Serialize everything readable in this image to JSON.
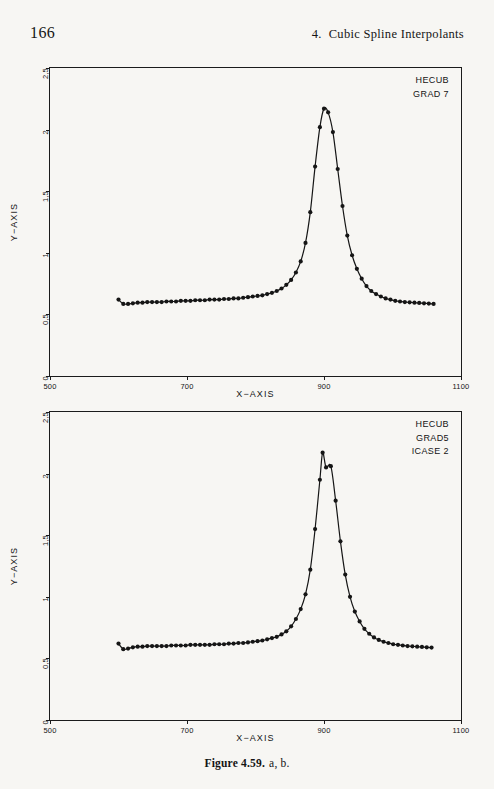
{
  "page": {
    "folio": "166",
    "header_chapter_num": "4.",
    "header_chapter_title": "Cubic Spline Interpolants",
    "background_color": "#f7f6f3",
    "ink_color": "#1b1b1b"
  },
  "caption": {
    "figure_number": "Figure 4.59.",
    "parts": "a, b."
  },
  "chart_data": [
    {
      "id": "figure-a",
      "type": "line",
      "title": "",
      "xlabel": "X−AXIS",
      "ylabel": "Y−AXIS",
      "xlim": [
        500,
        1100
      ],
      "ylim": [
        0,
        2.5
      ],
      "xticks": [
        500,
        700,
        900,
        1100
      ],
      "xticklabels": [
        "500",
        "700",
        "900",
        "1100"
      ],
      "yticks": [
        0,
        0.5,
        1,
        1.5,
        2,
        2.5
      ],
      "yticklabels": [
        "0",
        "0,5",
        "1",
        "1,5",
        "2",
        "2,5"
      ],
      "grid": false,
      "legend_position": "top-right",
      "annotations": [
        "HECUB",
        "GRAD 7"
      ],
      "marker": "filled-circle",
      "line_color": "#151515",
      "series": [
        {
          "name": "HECUB GRAD 7",
          "x": [
            600,
            607,
            614,
            621,
            628,
            635,
            642,
            649,
            656,
            663,
            670,
            677,
            684,
            691,
            698,
            705,
            712,
            719,
            726,
            733,
            740,
            747,
            754,
            761,
            768,
            775,
            782,
            789,
            796,
            803,
            810,
            817,
            824,
            831,
            838,
            845,
            852,
            859,
            866,
            873,
            880,
            887,
            894,
            900,
            906,
            913,
            920,
            927,
            934,
            941,
            948,
            955,
            962,
            969,
            976,
            983,
            990,
            997,
            1004,
            1011,
            1018,
            1025,
            1032,
            1039,
            1046,
            1053,
            1060
          ],
          "y": [
            0.62,
            0.585,
            0.585,
            0.59,
            0.595,
            0.595,
            0.6,
            0.6,
            0.6,
            0.6,
            0.605,
            0.605,
            0.605,
            0.61,
            0.61,
            0.61,
            0.615,
            0.615,
            0.615,
            0.62,
            0.62,
            0.62,
            0.625,
            0.625,
            0.63,
            0.63,
            0.635,
            0.64,
            0.645,
            0.65,
            0.655,
            0.665,
            0.675,
            0.69,
            0.71,
            0.74,
            0.78,
            0.84,
            0.93,
            1.08,
            1.33,
            1.7,
            2.02,
            2.17,
            2.14,
            1.98,
            1.68,
            1.38,
            1.14,
            0.98,
            0.87,
            0.79,
            0.73,
            0.69,
            0.665,
            0.645,
            0.63,
            0.62,
            0.61,
            0.605,
            0.6,
            0.598,
            0.595,
            0.593,
            0.59,
            0.588,
            0.585
          ]
        }
      ]
    },
    {
      "id": "figure-b",
      "type": "line",
      "title": "",
      "xlabel": "X−AXIS",
      "ylabel": "Y−AXIS",
      "xlim": [
        500,
        1100
      ],
      "ylim": [
        0,
        2.5
      ],
      "xticks": [
        500,
        700,
        900,
        1100
      ],
      "xticklabels": [
        "500",
        "700",
        "900",
        "1100"
      ],
      "yticks": [
        0,
        0.5,
        1,
        1.5,
        2,
        2.5
      ],
      "yticklabels": [
        "0",
        "0,5",
        "1",
        "1,5",
        "2",
        "2,5"
      ],
      "grid": false,
      "legend_position": "top-right",
      "annotations": [
        "HECUB",
        "GRAD5",
        "ICASE 2"
      ],
      "marker": "filled-circle",
      "line_color": "#151515",
      "series": [
        {
          "name": "HECUB GRAD5 ICASE 2",
          "x": [
            600,
            607,
            614,
            621,
            628,
            635,
            642,
            649,
            656,
            663,
            670,
            677,
            684,
            691,
            698,
            705,
            712,
            719,
            726,
            733,
            740,
            747,
            754,
            761,
            768,
            775,
            782,
            789,
            796,
            803,
            810,
            817,
            824,
            831,
            838,
            845,
            852,
            859,
            866,
            873,
            880,
            887,
            894,
            898,
            903,
            910,
            917,
            924,
            931,
            938,
            945,
            952,
            959,
            966,
            973,
            980,
            987,
            994,
            1001,
            1008,
            1015,
            1022,
            1029,
            1036,
            1043,
            1050,
            1057
          ],
          "y": [
            0.62,
            0.575,
            0.58,
            0.59,
            0.595,
            0.595,
            0.6,
            0.6,
            0.6,
            0.6,
            0.6,
            0.605,
            0.605,
            0.605,
            0.605,
            0.61,
            0.61,
            0.61,
            0.61,
            0.61,
            0.615,
            0.615,
            0.615,
            0.62,
            0.62,
            0.625,
            0.625,
            0.63,
            0.635,
            0.64,
            0.645,
            0.655,
            0.665,
            0.675,
            0.695,
            0.72,
            0.76,
            0.82,
            0.9,
            1.02,
            1.22,
            1.55,
            1.95,
            2.17,
            2.05,
            2.06,
            1.78,
            1.45,
            1.18,
            1.0,
            0.88,
            0.8,
            0.74,
            0.7,
            0.67,
            0.65,
            0.635,
            0.625,
            0.615,
            0.61,
            0.605,
            0.6,
            0.598,
            0.595,
            0.593,
            0.59,
            0.588
          ]
        }
      ]
    }
  ]
}
